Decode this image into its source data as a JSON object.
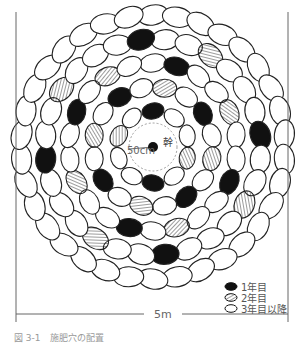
{
  "diagram": {
    "center": {
      "x": 153,
      "y": 147
    },
    "inner_radius_label": "50cm",
    "trunk_label": "幹",
    "scale": {
      "label": "5m",
      "x1": 16,
      "x2": 288,
      "y": 314
    },
    "caption": "図 3-1　施肥穴の配置",
    "rings": [
      {
        "radius": 132,
        "count": 34,
        "rx": 15,
        "ry": 10,
        "pattern": []
      },
      {
        "radius": 108,
        "count": 28,
        "rx": 14,
        "ry": 10,
        "pattern": [
          {
            "i": 2,
            "t": "y2"
          },
          {
            "i": 6,
            "t": "y1"
          },
          {
            "i": 9,
            "t": "y2"
          },
          {
            "i": 13,
            "t": "y1"
          },
          {
            "i": 16,
            "t": "y2"
          },
          {
            "i": 20,
            "t": "y1"
          },
          {
            "i": 23,
            "t": "y2"
          },
          {
            "i": 27,
            "t": "y1"
          }
        ]
      },
      {
        "radius": 84,
        "count": 22,
        "rx": 13,
        "ry": 9,
        "pattern": [
          {
            "i": 1,
            "t": "y1"
          },
          {
            "i": 4,
            "t": "y2"
          },
          {
            "i": 7,
            "t": "y1"
          },
          {
            "i": 10,
            "t": "y2"
          },
          {
            "i": 12,
            "t": "y1"
          },
          {
            "i": 15,
            "t": "y2"
          },
          {
            "i": 18,
            "t": "y1"
          },
          {
            "i": 20,
            "t": "y2"
          }
        ]
      },
      {
        "radius": 60,
        "count": 16,
        "rx": 12,
        "ry": 9,
        "pattern": [
          {
            "i": 0,
            "t": "y2"
          },
          {
            "i": 2,
            "t": "y1"
          },
          {
            "i": 4,
            "t": "y2"
          },
          {
            "i": 6,
            "t": "y1"
          },
          {
            "i": 8,
            "t": "y2"
          },
          {
            "i": 10,
            "t": "y1"
          },
          {
            "i": 12,
            "t": "y2"
          },
          {
            "i": 14,
            "t": "y1"
          }
        ]
      },
      {
        "radius": 36,
        "count": 10,
        "rx": 11,
        "ry": 8,
        "pattern": [
          {
            "i": 0,
            "t": "y1"
          },
          {
            "i": 3,
            "t": "y2"
          },
          {
            "i": 5,
            "t": "y1"
          },
          {
            "i": 8,
            "t": "y2"
          }
        ]
      }
    ]
  },
  "legend": {
    "items": [
      {
        "type": "y1",
        "label": "1年目"
      },
      {
        "type": "y2",
        "label": "2年目"
      },
      {
        "type": "y3",
        "label": "3年目以降"
      }
    ]
  },
  "colors": {
    "stroke": "#222222",
    "fill_y1": "#111111",
    "fill_y3": "#ffffff",
    "text": "#555555"
  }
}
